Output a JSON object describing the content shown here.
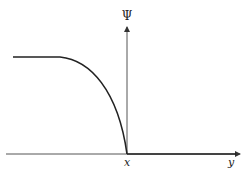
{
  "diagram": {
    "vertical_axis_label": "Ψ",
    "x_marker_label": "x",
    "horizontal_axis_label": "y",
    "curve": {
      "description": "flat plateau on the left, then curving down steeply to reach zero at x",
      "color": "#222222"
    },
    "axis_color": "#444444"
  }
}
